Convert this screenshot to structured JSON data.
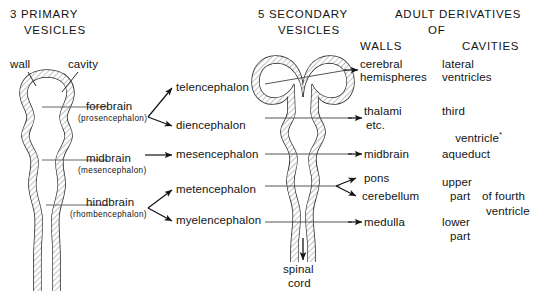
{
  "figure": {
    "background_color": "#ffffff",
    "ink_color": "#141414"
  },
  "headers": {
    "primary": {
      "line1": "3 PRIMARY",
      "line2": "VESICLES"
    },
    "secondary": {
      "line1": "5 SECONDARY",
      "line2": "VESICLES"
    },
    "adult": {
      "line1": "ADULT DERIVATIVES",
      "line2": "OF"
    },
    "walls": "WALLS",
    "cavities": "CAVITIES"
  },
  "callouts": {
    "wall": "wall",
    "cavity": "cavity"
  },
  "primary_vesicles": [
    {
      "name": "forebrain",
      "alt": "(prosencephalon)"
    },
    {
      "name": "midbrain",
      "alt": "(mesencephalon)"
    },
    {
      "name": "hindbrain",
      "alt": "(rhombencephalon)"
    }
  ],
  "secondary_vesicles": [
    "telencephalon",
    "diencephalon",
    "mesencephalon",
    "metencephalon",
    "myelencephalon"
  ],
  "adult_walls": [
    {
      "line1": "cerebral",
      "line2": "hemispheres"
    },
    {
      "line1": "thalami",
      "line2": "etc."
    },
    {
      "line1": "midbrain",
      "line2": ""
    },
    {
      "line1": "pons",
      "line2": ""
    },
    {
      "line1": "cerebellum",
      "line2": ""
    },
    {
      "line1": "medulla",
      "line2": ""
    }
  ],
  "adult_cavities": [
    {
      "line1": "lateral",
      "line2": "ventricles"
    },
    {
      "line1": "third",
      "line2": "ventricle",
      "marker": "*"
    },
    {
      "line1": "aqueduct",
      "line2": ""
    },
    {
      "line1": "upper",
      "line2": "part"
    },
    {
      "line1": "lower",
      "line2": "part"
    }
  ],
  "fourth_ventricle": {
    "line1": "of fourth",
    "line2": "ventricle"
  },
  "spinal_cord": {
    "line1": "spinal",
    "line2": "cord"
  }
}
